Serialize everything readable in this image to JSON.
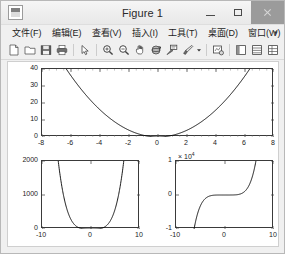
{
  "window": {
    "title": "Figure 1",
    "app_icon_name": "matlab-figure-icon",
    "controls": {
      "minimize": "─",
      "maximize": "□",
      "close": "✕"
    }
  },
  "menubar": {
    "items": [
      {
        "label": "文件(F)",
        "name": "menu-file"
      },
      {
        "label": "编辑(E)",
        "name": "menu-edit"
      },
      {
        "label": "查看(V)",
        "name": "menu-view"
      },
      {
        "label": "插入(I)",
        "name": "menu-insert"
      },
      {
        "label": "工具(T)",
        "name": "menu-tools"
      },
      {
        "label": "桌面(D)",
        "name": "menu-desktop"
      },
      {
        "label": "窗口(W)",
        "name": "menu-window"
      },
      {
        "label": "帮助(H)",
        "name": "menu-help"
      }
    ],
    "overflow": "▾"
  },
  "toolbar": {
    "buttons": [
      "new-figure-icon",
      "open-file-icon",
      "save-figure-icon",
      "print-figure-icon",
      "separator",
      "pointer-arrow-icon",
      "separator",
      "zoom-in-icon",
      "zoom-out-icon",
      "pan-hand-icon",
      "rotate-3d-icon",
      "data-cursor-icon",
      "brush-icon",
      "brush-dropdown-arrow",
      "separator",
      "link-plot-icon",
      "separator",
      "figure-palette-icon",
      "plot-browser-icon",
      "property-editor-icon",
      "separator",
      "insert-colorbar-icon",
      "insert-legend-icon"
    ]
  },
  "chart_data": [
    {
      "name": "top-plot",
      "type": "line",
      "title": "",
      "xlabel": "",
      "ylabel": "",
      "xlim": [
        -8,
        8
      ],
      "ylim": [
        0,
        40
      ],
      "xticks": [
        -8,
        -6,
        -4,
        -2,
        0,
        2,
        4,
        6,
        8
      ],
      "yticks": [
        0,
        10,
        20,
        30,
        40
      ],
      "xticklabels": [
        "-8",
        "-6",
        "-4",
        "-2",
        "0",
        "2",
        "4",
        "6",
        "8"
      ],
      "yticklabels": [
        "0",
        "10",
        "20",
        "30",
        "40"
      ],
      "grid": false,
      "legend": null,
      "series": [
        {
          "name": "y = x^2",
          "color": "#000000",
          "x": [
            -8,
            -7.5,
            -7,
            -6.5,
            -6.32,
            -6,
            -5.5,
            -5,
            -4.5,
            -4,
            -3.5,
            -3,
            -2.5,
            -2,
            -1.5,
            -1,
            -0.5,
            0,
            0.5,
            1,
            1.5,
            2,
            2.5,
            3,
            3.5,
            4,
            4.5,
            5,
            5.5,
            6,
            6.32,
            6.5,
            7,
            7.5,
            8
          ],
          "y": [
            64,
            56.25,
            49,
            42.25,
            40,
            36,
            30.25,
            25,
            20.25,
            16,
            12.25,
            9,
            6.25,
            4,
            2.25,
            1,
            0.25,
            0,
            0.25,
            1,
            2.25,
            4,
            6.25,
            9,
            12.25,
            16,
            20.25,
            25,
            30.25,
            36,
            40,
            42.25,
            49,
            56.25,
            64
          ]
        }
      ]
    },
    {
      "name": "bottom-left-plot",
      "type": "line",
      "title": "",
      "xlabel": "",
      "ylabel": "",
      "xlim": [
        -10,
        10
      ],
      "ylim": [
        0,
        2000
      ],
      "xticks": [
        -10,
        0,
        10
      ],
      "yticks": [
        0,
        1000,
        2000
      ],
      "xticklabels": [
        "-10",
        "0",
        "10"
      ],
      "yticklabels": [
        "0",
        "1000",
        "2000"
      ],
      "grid": false,
      "legend": null,
      "series": [
        {
          "name": "y = x^4",
          "color": "#000000",
          "x": [
            -10,
            -9,
            -8,
            -7,
            -6.69,
            -6.5,
            -6,
            -5.5,
            -5,
            -4.5,
            -4,
            -3.5,
            -3,
            -2.5,
            -2,
            -1.5,
            -1,
            -0.5,
            0,
            0.5,
            1,
            1.5,
            2,
            2.5,
            3,
            3.5,
            4,
            4.5,
            5,
            5.5,
            6,
            6.5,
            6.69,
            7,
            8,
            9,
            10
          ],
          "y": [
            10000,
            6561,
            4096,
            2401,
            2000,
            1785,
            1296,
            915,
            625,
            410,
            256,
            150,
            81,
            39,
            16,
            5.06,
            1,
            0.06,
            0,
            0.06,
            1,
            5.06,
            16,
            39,
            81,
            150,
            256,
            410,
            625,
            915,
            1296,
            1785,
            2000,
            2401,
            4096,
            6561,
            10000
          ]
        }
      ]
    },
    {
      "name": "bottom-right-plot",
      "type": "line",
      "title": "",
      "xlabel": "",
      "ylabel": "",
      "exponent_label": "× 10",
      "exponent_value": "4",
      "xlim": [
        -10,
        10
      ],
      "ylim": [
        -10000,
        10000
      ],
      "xticks": [
        -10,
        0,
        10
      ],
      "yticks": [
        -10000,
        0,
        10000
      ],
      "xticklabels": [
        "-10",
        "0",
        "10"
      ],
      "yticklabels": [
        "-1",
        "0",
        "1"
      ],
      "grid": false,
      "legend": null,
      "series": [
        {
          "name": "y = x^5",
          "color": "#000000",
          "x": [
            -10,
            -9,
            -8,
            -7,
            -6.31,
            -6,
            -5.5,
            -5,
            -4.5,
            -4,
            -3.5,
            -3,
            -2.5,
            -2,
            -1.5,
            -1,
            -0.5,
            0,
            0.5,
            1,
            1.5,
            2,
            2.5,
            3,
            3.5,
            4,
            4.5,
            5,
            5.5,
            6,
            6.31,
            7,
            8,
            9,
            10
          ],
          "y": [
            -100000,
            -59049,
            -32768,
            -16807,
            -10000,
            -7776,
            -5033,
            -3125,
            -1845,
            -1024,
            -525,
            -243,
            -98,
            -32,
            -7.6,
            -1,
            -0.03,
            0,
            0.03,
            1,
            7.6,
            32,
            98,
            243,
            525,
            1024,
            1845,
            3125,
            5033,
            7776,
            10000,
            16807,
            32768,
            59049,
            100000
          ]
        }
      ]
    }
  ]
}
